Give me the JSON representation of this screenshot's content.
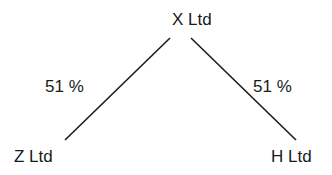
{
  "diagram": {
    "parent": {
      "label": "X Ltd"
    },
    "subsidiaries": [
      {
        "label": "Z Ltd",
        "ownership": "51 %"
      },
      {
        "label": "H Ltd",
        "ownership": "51 %"
      }
    ],
    "line_color": "#1a1a1a"
  }
}
